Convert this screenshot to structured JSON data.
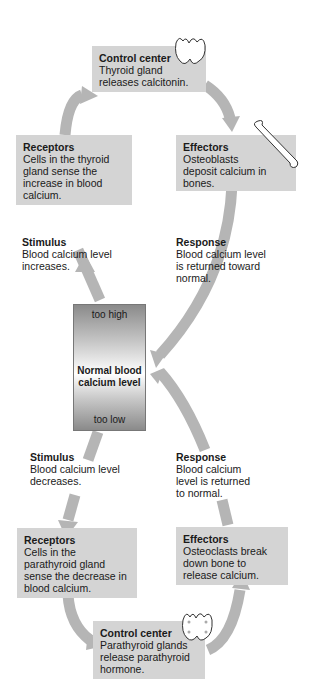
{
  "center": {
    "too_high": "too high",
    "label": "Normal blood calcium level",
    "too_low": "too low"
  },
  "upper_loop": {
    "stimulus": {
      "title": "Stimulus",
      "text": "Blood calcium level increases."
    },
    "receptors": {
      "title": "Receptors",
      "text": "Cells in the thyroid gland sense the increase in blood calcium."
    },
    "control_center": {
      "title": "Control center",
      "text": "Thyroid gland releases calcitonin."
    },
    "effectors": {
      "title": "Effectors",
      "text": "Osteoblasts deposit calcium in bones."
    },
    "response": {
      "title": "Response",
      "text": "Blood calcium level is returned toward normal."
    }
  },
  "lower_loop": {
    "stimulus": {
      "title": "Stimulus",
      "text": "Blood calcium level decreases."
    },
    "receptors": {
      "title": "Receptors",
      "text": "Cells in the parathyroid gland sense the decrease in blood calcium."
    },
    "control_center": {
      "title": "Control center",
      "text": "Parathyroid glands release parathyroid hormone."
    },
    "effectors": {
      "title": "Effectors",
      "text": "Osteoclasts break down bone to release calcium."
    },
    "response": {
      "title": "Response",
      "text": "Blood calcium level is returned to normal."
    }
  },
  "colors": {
    "box": "#d4d4d4",
    "arrow": "#b5b5b5"
  }
}
